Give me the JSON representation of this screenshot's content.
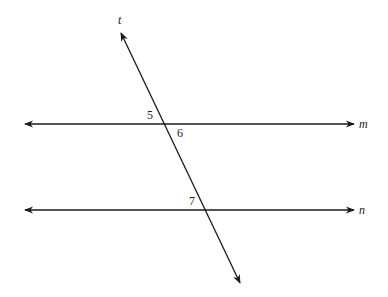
{
  "diagram": {
    "type": "parallel-lines-cut-by-transversal",
    "lines": {
      "m": {
        "label": "m",
        "y": 124
      },
      "n": {
        "label": "n",
        "y": 210
      },
      "t": {
        "label": "t"
      }
    },
    "angles": [
      {
        "label": "5",
        "at": "m",
        "position": "upper-left"
      },
      {
        "label": "6",
        "at": "m",
        "position": "lower-right"
      },
      {
        "label": "7",
        "at": "n",
        "position": "upper-left"
      }
    ],
    "stroke_color": "#1a1a1a"
  }
}
